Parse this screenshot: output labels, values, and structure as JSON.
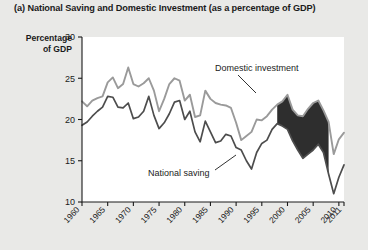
{
  "figure": {
    "caption": "(a) National Saving and Domestic Investment (as a percentage of GDP)",
    "axis_title_line1": "Percentage",
    "axis_title_line2": "of GDP",
    "background_color": "#e9e9e7",
    "plot_background_color": "#ffffff"
  },
  "chart_data": {
    "type": "line",
    "title": "(a) National Saving and Domestic Investment (as a percentage of GDP)",
    "xlabel": "",
    "ylabel": "Percentage of GDP",
    "xlim": [
      1960,
      2011
    ],
    "ylim": [
      10,
      30
    ],
    "yticks": [
      10,
      15,
      20,
      25,
      30
    ],
    "xticks": [
      1960,
      1965,
      1970,
      1975,
      1980,
      1985,
      1990,
      1995,
      2000,
      2005,
      2010,
      2011
    ],
    "xtick_labels": [
      "1960",
      "1965",
      "1970",
      "1975",
      "1980",
      "1985",
      "1990",
      "1995",
      "2000",
      "2005",
      "2010",
      "2011"
    ],
    "grid": false,
    "legend": "annotations",
    "annotations": [
      {
        "text": "Domestic investment",
        "series": "domestic_investment"
      },
      {
        "text": "National saving",
        "series": "national_saving"
      }
    ],
    "shaded_region": {
      "label": "gap where domestic investment exceeds national saving",
      "color": "#1c1c1c",
      "x_start": 1998,
      "x_end": 2008
    },
    "colors": {
      "domestic_investment": "#9a9a9a",
      "national_saving": "#4d4d4d"
    },
    "x": [
      1960,
      1961,
      1962,
      1963,
      1964,
      1965,
      1966,
      1967,
      1968,
      1969,
      1970,
      1971,
      1972,
      1973,
      1974,
      1975,
      1976,
      1977,
      1978,
      1979,
      1980,
      1981,
      1982,
      1983,
      1984,
      1985,
      1986,
      1987,
      1988,
      1989,
      1990,
      1991,
      1992,
      1993,
      1994,
      1995,
      1996,
      1997,
      1998,
      1999,
      2000,
      2001,
      2002,
      2003,
      2004,
      2005,
      2006,
      2007,
      2008,
      2009,
      2010,
      2011
    ],
    "series": [
      {
        "name": "Domestic investment",
        "key": "domestic_investment",
        "color": "#9a9a9a",
        "values": [
          22.2,
          21.6,
          22.3,
          22.6,
          22.8,
          24.5,
          25.1,
          23.8,
          24.3,
          26.3,
          24.3,
          24.0,
          24.4,
          25.0,
          23.5,
          21.0,
          22.5,
          24.3,
          25.0,
          24.7,
          22.3,
          23.0,
          20.3,
          20.5,
          23.5,
          22.5,
          22.0,
          21.8,
          21.7,
          21.4,
          19.6,
          17.5,
          18.0,
          18.5,
          20.0,
          19.9,
          20.4,
          21.2,
          21.8,
          22.2,
          23.0,
          21.2,
          20.5,
          20.4,
          21.3,
          22.0,
          22.3,
          21.1,
          19.7,
          15.8,
          17.6,
          18.4
        ]
      },
      {
        "name": "National saving",
        "key": "national_saving",
        "color": "#4d4d4d",
        "values": [
          19.3,
          19.7,
          20.4,
          21.0,
          21.5,
          22.8,
          22.7,
          21.5,
          21.4,
          22.0,
          20.1,
          20.3,
          21.0,
          22.8,
          20.5,
          18.9,
          19.6,
          20.7,
          22.1,
          22.3,
          20.0,
          21.0,
          18.5,
          17.3,
          19.8,
          18.5,
          17.2,
          17.4,
          18.2,
          18.0,
          16.6,
          16.3,
          15.0,
          14.0,
          16.0,
          17.1,
          17.5,
          18.8,
          19.5,
          19.2,
          18.8,
          17.4,
          16.3,
          15.3,
          15.8,
          16.3,
          17.0,
          16.0,
          13.4,
          11.0,
          13.0,
          14.5
        ]
      }
    ]
  }
}
